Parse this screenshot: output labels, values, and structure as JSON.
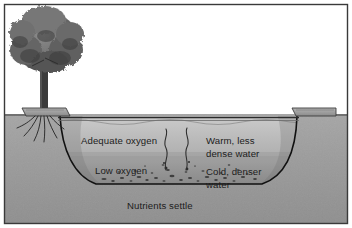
{
  "figure": {
    "frame_color": "#3a3a3a",
    "sky_color": "#ffffff",
    "soil_color": "#9a9a9a",
    "water_upper_color": "#b9b9b9",
    "water_lower_color": "#8e8e8e",
    "outline_color": "#111111",
    "text_color": "#1c1c1c"
  },
  "labels": {
    "adequate_oxygen": "Adequate oxygen",
    "low_oxygen": "Low oxygen",
    "warm_line1": "Warm, less",
    "warm_line2": "dense water",
    "cold_line1": "Cold, denser",
    "cold_line2": "water",
    "nutrients_settle": "Nutrients settle"
  },
  "scene": {
    "tree_name": "deciduous-tree",
    "bank_left_name": "left-bank",
    "bank_right_name": "right-bank",
    "water_surface_name": "water-surface-line",
    "thermocline_name": "thermocline-boundary",
    "sediment_name": "sediment-layer",
    "gas_plume_count": 2
  }
}
